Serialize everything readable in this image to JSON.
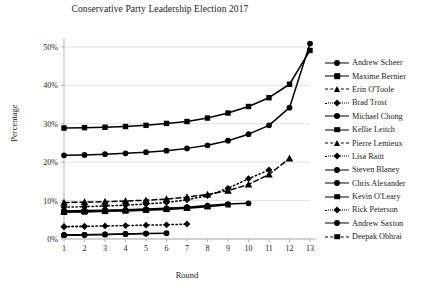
{
  "chart_data": {
    "type": "line",
    "title": "Conservative Party Leadership Election 2017",
    "xlabel": "Round",
    "ylabel": "Percentage",
    "xlim": [
      1,
      13
    ],
    "ylim": [
      0,
      50
    ],
    "grid": true,
    "legend_position": "right",
    "x": [
      1,
      2,
      3,
      4,
      5,
      6,
      7,
      8,
      9,
      10,
      11,
      12,
      13
    ],
    "xtick_labels": [
      "1",
      "2",
      "3",
      "4",
      "5",
      "6",
      "7",
      "8",
      "9",
      "10",
      "11",
      "12",
      "13"
    ],
    "ytick_labels": [
      "0%",
      "10%",
      "20%",
      "30%",
      "40%",
      "50%"
    ],
    "ytick_values": [
      0,
      10,
      20,
      30,
      40,
      50
    ],
    "series": [
      {
        "name": "Andrew Scheer",
        "marker": "circle",
        "line": "solid",
        "values": [
          21.8,
          21.9,
          22.1,
          22.3,
          22.6,
          23.0,
          23.6,
          24.4,
          25.6,
          27.3,
          29.6,
          34.2,
          50.9
        ]
      },
      {
        "name": "Maxime Bernier",
        "marker": "square",
        "line": "solid",
        "values": [
          28.9,
          29.0,
          29.1,
          29.3,
          29.6,
          30.1,
          30.6,
          31.5,
          32.8,
          34.5,
          36.8,
          40.3,
          49.1
        ]
      },
      {
        "name": "Erin O'Toole",
        "marker": "triangle",
        "line": "dashed",
        "values": [
          9.5,
          9.6,
          9.7,
          9.9,
          10.1,
          10.4,
          10.9,
          11.6,
          12.6,
          14.2,
          16.8,
          21.0,
          null
        ]
      },
      {
        "name": "Brad Trost",
        "marker": "diamond",
        "line": "dotted",
        "values": [
          8.3,
          8.4,
          8.6,
          8.8,
          9.1,
          9.5,
          10.2,
          11.3,
          13.2,
          15.7,
          18.0,
          null,
          null
        ]
      },
      {
        "name": "Michael Chong",
        "marker": "circle",
        "line": "solid",
        "values": [
          7.3,
          7.4,
          7.5,
          7.6,
          7.8,
          8.0,
          8.3,
          8.7,
          9.1,
          9.3,
          null,
          null,
          null
        ]
      },
      {
        "name": "Kellie Leitch",
        "marker": "square",
        "line": "solid",
        "values": [
          7.0,
          7.1,
          7.2,
          7.3,
          7.5,
          7.7,
          8.0,
          8.4,
          8.9,
          null,
          null,
          null,
          null
        ]
      },
      {
        "name": "Pierre Lemieux",
        "marker": "triangle",
        "line": "dashed",
        "values": [
          7.2,
          7.3,
          7.4,
          7.5,
          7.7,
          7.9,
          8.2,
          8.6,
          null,
          null,
          null,
          null,
          null
        ]
      },
      {
        "name": "Lisa Raitt",
        "marker": "diamond",
        "line": "dotted",
        "values": [
          3.2,
          3.3,
          3.4,
          3.5,
          3.6,
          3.7,
          3.9,
          null,
          null,
          null,
          null,
          null,
          null
        ]
      },
      {
        "name": "Steven Blaney",
        "marker": "circle",
        "line": "solid",
        "values": [
          1.0,
          1.1,
          1.2,
          1.3,
          1.4,
          1.5,
          null,
          null,
          null,
          null,
          null,
          null,
          null
        ]
      },
      {
        "name": "Chris Alexander",
        "marker": "circle",
        "line": "solid",
        "values": [
          1.0,
          1.1,
          1.2,
          1.3,
          1.4,
          null,
          null,
          null,
          null,
          null,
          null,
          null,
          null
        ]
      },
      {
        "name": "Kevin O'Leary",
        "marker": "square",
        "line": "solid",
        "values": [
          7.0,
          7.1,
          7.2,
          null,
          null,
          null,
          null,
          null,
          null,
          null,
          null,
          null,
          null
        ]
      },
      {
        "name": "Rick Peterson",
        "marker": "diamond",
        "line": "dotted",
        "values": [
          3.2,
          3.3,
          null,
          null,
          null,
          null,
          null,
          null,
          null,
          null,
          null,
          null,
          null
        ]
      },
      {
        "name": "Andrew Saxton",
        "marker": "circle",
        "line": "solid",
        "values": [
          1.0,
          1.1,
          null,
          null,
          null,
          null,
          null,
          null,
          null,
          null,
          null,
          null,
          null
        ]
      },
      {
        "name": "Deepak Obhrai",
        "marker": "square",
        "line": "dashed",
        "values": [
          7.0,
          null,
          null,
          null,
          null,
          null,
          null,
          null,
          null,
          null,
          null,
          null,
          null
        ]
      }
    ]
  },
  "plot_geometry": {
    "left": 64,
    "right": 310,
    "top": 47,
    "bottom": 239
  },
  "colors": {
    "ink": "#1a1a1a",
    "grid": "#d9d9d9",
    "axis": "#b3b3b3",
    "series": "#000000"
  }
}
